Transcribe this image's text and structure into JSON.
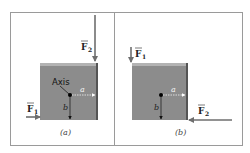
{
  "figure": {
    "panels": [
      {
        "id": "a",
        "caption": "(a)",
        "axis_label": "Axis",
        "dim_a": "a",
        "dim_b": "b",
        "force1": {
          "symbol": "F",
          "subscript": "1",
          "direction": "right",
          "location": "bottom-left edge"
        },
        "force2": {
          "symbol": "F",
          "subscript": "2",
          "direction": "down",
          "location": "top-right corner"
        }
      },
      {
        "id": "b",
        "caption": "(b)",
        "dim_a": "a",
        "dim_b": "b",
        "force1": {
          "symbol": "F",
          "subscript": "1",
          "direction": "down",
          "location": "top-left corner"
        },
        "force2": {
          "symbol": "F",
          "subscript": "2",
          "direction": "left",
          "location": "bottom-right edge"
        }
      }
    ],
    "colors": {
      "block": "#8c8c8c",
      "block_top": "#b3b3b3",
      "block_edge": "#555555",
      "arrow": "#6e6e6e",
      "frame": "#9a9a9a"
    }
  }
}
